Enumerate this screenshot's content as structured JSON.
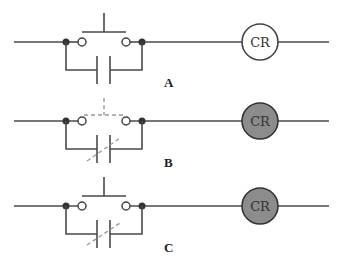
{
  "diagram": {
    "type": "ladder-logic-pushbutton-seal-in",
    "colors": {
      "wire": "#4a4a4a",
      "dashed": "#9a9a9a",
      "coil_energized": "#8c8c8c",
      "coil_deenergized": "#ffffff"
    },
    "rungs": [
      {
        "label": "A",
        "coil_label": "CR",
        "coil_energized": false,
        "pushbutton_state": "released",
        "seal_in_contact_state": "open"
      },
      {
        "label": "B",
        "coil_label": "CR",
        "coil_energized": true,
        "pushbutton_state": "pressed",
        "seal_in_contact_state": "closed"
      },
      {
        "label": "C",
        "coil_label": "CR",
        "coil_energized": true,
        "pushbutton_state": "released",
        "seal_in_contact_state": "closed"
      }
    ]
  }
}
